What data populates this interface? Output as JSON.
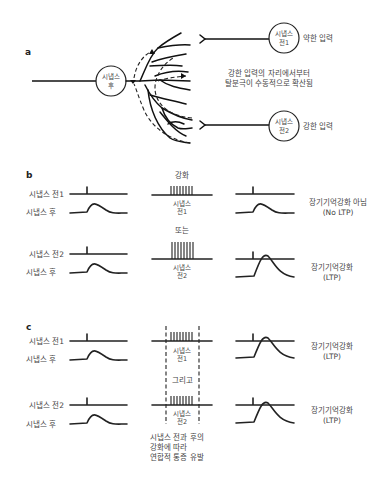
{
  "panel_a": {
    "label": "a",
    "post_neuron": {
      "line1": "시냅스",
      "line2": "후"
    },
    "pre1_neuron": {
      "line1": "시냅스",
      "line2": "전1"
    },
    "pre2_neuron": {
      "line1": "시냅스",
      "line2": "전2"
    },
    "weak_input": "약한 입력",
    "strong_input": "강한 입력",
    "spread_text_line1": "강한 입력의 자리에서부터",
    "spread_text_line2": "탈분극이 수동적으로 확산됨"
  },
  "panel_b": {
    "label": "b",
    "row_labels": {
      "pre1": "시냅스 전1",
      "post_a": "시냅스 후",
      "pre2": "시냅스 전2",
      "post_b": "시냅스 후"
    },
    "tetanus_title": "강화",
    "stim1": {
      "line1": "시냅스",
      "line2": "전1"
    },
    "or_text": "또는",
    "stim2": {
      "line1": "시냅스",
      "line2": "전2"
    },
    "result1": {
      "line1": "장기기억강화 아님",
      "line2": "(No LTP)"
    },
    "result2": {
      "line1": "장기기억강화",
      "line2": "(LTP)"
    }
  },
  "panel_c": {
    "label": "c",
    "row_labels": {
      "pre1": "시냅스 전1",
      "post_a": "시냅스 후",
      "pre2": "시냅스 전2",
      "post_b": "시냅스 후"
    },
    "stim1": {
      "line1": "시냅스",
      "line2": "전1"
    },
    "and_text": "그리고",
    "stim2": {
      "line1": "시냅스",
      "line2": "전2"
    },
    "result1": {
      "line1": "장기기억강화",
      "line2": "(LTP)"
    },
    "result2": {
      "line1": "장기기억강화",
      "line2": "(LTP)"
    },
    "caption_line1": "시냅스 전과 후의",
    "caption_line2": "강화에 따라",
    "caption_line3": "연합적 통증 유발"
  }
}
